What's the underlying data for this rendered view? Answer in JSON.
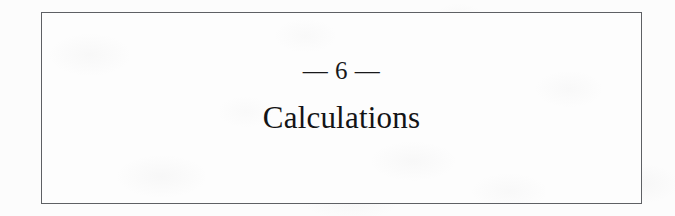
{
  "page": {
    "type": "book-chapter-opener",
    "paper_color": "#fcfcfc",
    "ink_color": "#18181a",
    "rule_color": "#5e6064"
  },
  "chapter": {
    "number_ornament": "— 6 —",
    "number": "6",
    "ornament_glyph": "—",
    "title": "Calculations"
  }
}
